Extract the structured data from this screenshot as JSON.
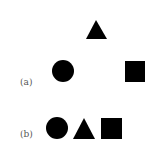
{
  "figure": {
    "panel_a": {
      "label": "(a)",
      "shapes": [
        "triangle",
        "circle",
        "square"
      ],
      "arrangement": "triangle on top, circle bottom-left, square bottom-right (spread apart)"
    },
    "panel_b": {
      "label": "(b)",
      "shapes": [
        "circle",
        "triangle",
        "square"
      ],
      "arrangement": "circle, triangle, square in a compact row"
    },
    "shape_color": "#000000"
  }
}
